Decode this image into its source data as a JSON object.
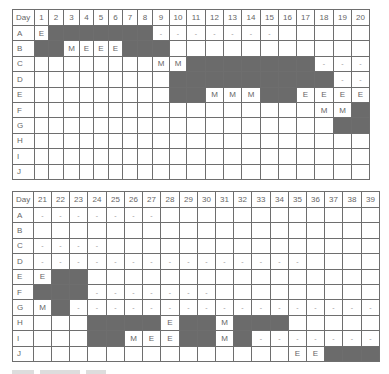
{
  "legend": {
    "dark": "shaded cell (occupied)",
    "M": "M",
    "E": "E",
    "-": "dash"
  },
  "colors": {
    "dark_cell": "#6b6b6b",
    "grid": "#6e6e6e",
    "text": "#666666"
  },
  "tables": [
    {
      "header_label": "Day",
      "days": [
        1,
        2,
        3,
        4,
        5,
        6,
        7,
        8,
        9,
        10,
        11,
        12,
        13,
        14,
        15,
        16,
        17,
        18,
        19,
        20
      ],
      "col_widths": [
        22,
        14,
        15,
        16,
        14,
        15,
        14,
        15,
        15,
        17,
        17,
        19,
        18,
        18,
        19,
        18,
        18,
        18,
        19,
        18,
        18
      ],
      "rows": [
        {
          "label": "A",
          "cells": [
            "E",
            "#",
            "#",
            "#",
            "#",
            "#",
            "#",
            "#",
            "-",
            "-",
            "-",
            "-",
            "-",
            "-",
            "-",
            "",
            "",
            "",
            "",
            ""
          ]
        },
        {
          "label": "B",
          "cells": [
            "#",
            "#",
            "M",
            "E",
            "E",
            "E",
            "#",
            "#",
            "#",
            "",
            "",
            "",
            "",
            "",
            "",
            "",
            "",
            "",
            "",
            ""
          ]
        },
        {
          "label": "C",
          "cells": [
            "",
            "",
            "",
            "",
            "",
            "",
            "",
            "",
            "M",
            "M",
            "#",
            "#",
            "#",
            "#",
            "#",
            "#",
            "#",
            "-",
            "-",
            "-"
          ]
        },
        {
          "label": "D",
          "cells": [
            "",
            "",
            "",
            "",
            "",
            "",
            "",
            "",
            "",
            "#",
            "#",
            "#",
            "#",
            "#",
            "#",
            "#",
            "#",
            "#",
            "-",
            "-"
          ]
        },
        {
          "label": "E",
          "cells": [
            "",
            "",
            "",
            "",
            "",
            "",
            "",
            "",
            "",
            "#",
            "#",
            "M",
            "M",
            "M",
            "#",
            "#",
            "E",
            "E",
            "E",
            "E"
          ]
        },
        {
          "label": "F",
          "cells": [
            "",
            "",
            "",
            "",
            "",
            "",
            "",
            "",
            "",
            "",
            "",
            "",
            "",
            "",
            "",
            "",
            "",
            "M",
            "M",
            "#"
          ]
        },
        {
          "label": "G",
          "cells": [
            "",
            "",
            "",
            "",
            "",
            "",
            "",
            "",
            "",
            "",
            "",
            "",
            "",
            "",
            "",
            "",
            "",
            "",
            "#",
            "#"
          ]
        },
        {
          "label": "H",
          "cells": [
            "",
            "",
            "",
            "",
            "",
            "",
            "",
            "",
            "",
            "",
            "",
            "",
            "",
            "",
            "",
            "",
            "",
            "",
            "",
            ""
          ]
        },
        {
          "label": "I",
          "cells": [
            "",
            "",
            "",
            "",
            "",
            "",
            "",
            "",
            "",
            "",
            "",
            "",
            "",
            "",
            "",
            "",
            "",
            "",
            "",
            ""
          ]
        },
        {
          "label": "J",
          "cells": [
            "",
            "",
            "",
            "",
            "",
            "",
            "",
            "",
            "",
            "",
            "",
            "",
            "",
            "",
            "",
            "",
            "",
            "",
            "",
            ""
          ]
        }
      ]
    },
    {
      "header_label": "Day",
      "days": [
        21,
        22,
        23,
        24,
        25,
        26,
        27,
        28,
        29,
        30,
        31,
        32,
        33,
        34,
        35,
        36,
        37,
        38,
        39
      ],
      "col_widths": [
        21,
        18,
        18,
        18,
        19,
        18,
        18,
        18,
        19,
        18,
        18,
        18,
        18,
        19,
        18,
        18,
        18,
        18,
        19,
        18
      ],
      "rows": [
        {
          "label": "A",
          "cells": [
            "-",
            "-",
            "-",
            "-",
            "-",
            "-",
            "-",
            "",
            "",
            "",
            "",
            "",
            "",
            "",
            "",
            "",
            "",
            "",
            ""
          ]
        },
        {
          "label": "B",
          "cells": [
            "",
            "",
            "",
            "",
            "",
            "",
            "",
            "",
            "",
            "",
            "",
            "",
            "",
            "",
            "",
            "",
            "",
            "",
            ""
          ]
        },
        {
          "label": "C",
          "cells": [
            "-",
            "-",
            "-",
            "-",
            "",
            "",
            "",
            "",
            "",
            "",
            "",
            "",
            "",
            "",
            "",
            "",
            "",
            "",
            ""
          ]
        },
        {
          "label": "D",
          "cells": [
            "-",
            "-",
            "-",
            "-",
            "-",
            "-",
            "-",
            "-",
            "-",
            "-",
            "-",
            "-",
            "-",
            "-",
            "-",
            "",
            "",
            "",
            ""
          ]
        },
        {
          "label": "E",
          "cells": [
            "E",
            "#",
            "#",
            "",
            "",
            "",
            "",
            "",
            "",
            "",
            "",
            "",
            "",
            "",
            "",
            "",
            "",
            "",
            ""
          ]
        },
        {
          "label": "F",
          "cells": [
            "#",
            "#",
            "#",
            "-",
            "-",
            "-",
            "-",
            "-",
            "-",
            "-",
            "",
            "",
            "",
            "",
            "",
            "",
            "",
            "",
            ""
          ]
        },
        {
          "label": "G",
          "cells": [
            "M",
            "#",
            "-",
            "-",
            "-",
            "-",
            "-",
            "-",
            "-",
            "-",
            "-",
            "-",
            "-",
            "-",
            "-",
            "-",
            "-",
            "-",
            "-"
          ]
        },
        {
          "label": "H",
          "cells": [
            "",
            "",
            "",
            "#",
            "#",
            "#",
            "#",
            "E",
            "#",
            "#",
            "M",
            "#",
            "#",
            "#",
            "",
            "",
            "",
            "",
            ""
          ]
        },
        {
          "label": "I",
          "cells": [
            "",
            "",
            "",
            "#",
            "#",
            "M",
            "E",
            "E",
            "#",
            "#",
            "M",
            "#",
            "-",
            "-",
            "-",
            "-",
            "-",
            "-",
            "-"
          ]
        },
        {
          "label": "J",
          "cells": [
            "",
            "",
            "",
            "",
            "",
            "",
            "",
            "",
            "",
            "",
            "",
            "",
            "",
            "",
            "E",
            "E",
            "#",
            "#",
            "#"
          ]
        }
      ]
    }
  ]
}
